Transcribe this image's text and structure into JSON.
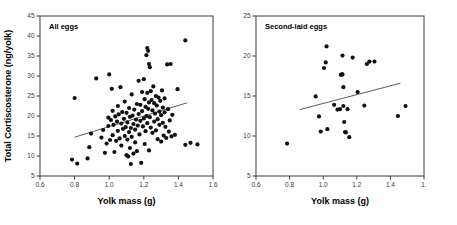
{
  "figure": {
    "axis_titles": {
      "x": "Yolk mass (g)",
      "y": "Total Cortiscosterone (ng/yolk)"
    }
  },
  "chart_data": [
    {
      "type": "scatter",
      "title": "All eggs",
      "xlabel": "Yolk mass (g)",
      "ylabel": "Total Cortiscosterone (ng/yolk)",
      "xlim": [
        0.6,
        1.6
      ],
      "ylim": [
        5,
        45
      ],
      "xticks": [
        0.6,
        0.8,
        1.0,
        1.2,
        1.4,
        1.6
      ],
      "xticklabels": [
        "0.6",
        "0.8",
        "1.0",
        "1.2",
        "1.4",
        "1.6"
      ],
      "yticks": [
        5,
        10,
        15,
        20,
        25,
        30,
        35,
        40,
        45
      ],
      "yticklabels": [
        "5",
        "10",
        "15",
        "20",
        "25",
        "30",
        "35",
        "40",
        "45"
      ],
      "grid": false,
      "legend": "none",
      "marker": "filled-circle",
      "trendline": {
        "x": [
          0.8,
          1.45
        ],
        "y": [
          14.7,
          23.3
        ]
      },
      "points": [
        [
          0.785,
          9.1
        ],
        [
          0.815,
          8.1
        ],
        [
          0.8,
          24.5
        ],
        [
          0.875,
          9.4
        ],
        [
          0.885,
          12.2
        ],
        [
          0.895,
          15.6
        ],
        [
          0.925,
          29.4
        ],
        [
          0.955,
          14.6
        ],
        [
          0.965,
          16.5
        ],
        [
          0.975,
          10.8
        ],
        [
          0.985,
          13.1
        ],
        [
          0.995,
          17.5
        ],
        [
          0.995,
          19.6
        ],
        [
          1.0,
          30.4
        ],
        [
          1.005,
          14.0
        ],
        [
          1.01,
          19.0
        ],
        [
          1.015,
          26.8
        ],
        [
          1.02,
          21.3
        ],
        [
          1.02,
          15.2
        ],
        [
          1.025,
          17.8
        ],
        [
          1.03,
          11.0
        ],
        [
          1.035,
          19.9
        ],
        [
          1.04,
          13.8
        ],
        [
          1.045,
          18.6
        ],
        [
          1.05,
          22.5
        ],
        [
          1.05,
          16.3
        ],
        [
          1.055,
          20.4
        ],
        [
          1.06,
          14.4
        ],
        [
          1.065,
          27.2
        ],
        [
          1.07,
          18.1
        ],
        [
          1.07,
          12.6
        ],
        [
          1.075,
          21.0
        ],
        [
          1.08,
          16.8
        ],
        [
          1.085,
          19.3
        ],
        [
          1.09,
          23.6
        ],
        [
          1.09,
          15.0
        ],
        [
          1.095,
          17.2
        ],
        [
          1.1,
          10.2
        ],
        [
          1.1,
          20.8
        ],
        [
          1.105,
          14.1
        ],
        [
          1.105,
          18.4
        ],
        [
          1.11,
          9.9
        ],
        [
          1.115,
          16.0
        ],
        [
          1.115,
          22.0
        ],
        [
          1.12,
          12.0
        ],
        [
          1.12,
          19.8
        ],
        [
          1.125,
          8.0
        ],
        [
          1.125,
          17.0
        ],
        [
          1.13,
          25.4
        ],
        [
          1.13,
          14.8
        ],
        [
          1.135,
          20.1
        ],
        [
          1.14,
          10.6
        ],
        [
          1.14,
          18.0
        ],
        [
          1.145,
          21.6
        ],
        [
          1.15,
          13.4
        ],
        [
          1.15,
          16.6
        ],
        [
          1.155,
          19.1
        ],
        [
          1.16,
          23.0
        ],
        [
          1.16,
          11.2
        ],
        [
          1.165,
          17.6
        ],
        [
          1.17,
          28.8
        ],
        [
          1.17,
          20.5
        ],
        [
          1.175,
          15.4
        ],
        [
          1.18,
          22.8
        ],
        [
          1.18,
          18.8
        ],
        [
          1.185,
          8.3
        ],
        [
          1.19,
          26.0
        ],
        [
          1.19,
          21.2
        ],
        [
          1.195,
          17.4
        ],
        [
          1.2,
          29.2
        ],
        [
          1.2,
          19.4
        ],
        [
          1.205,
          24.2
        ],
        [
          1.205,
          13.0
        ],
        [
          1.21,
          22.3
        ],
        [
          1.21,
          16.2
        ],
        [
          1.215,
          35.2
        ],
        [
          1.215,
          20.0
        ],
        [
          1.22,
          37.0
        ],
        [
          1.22,
          25.8
        ],
        [
          1.22,
          18.2
        ],
        [
          1.225,
          36.3
        ],
        [
          1.225,
          21.8
        ],
        [
          1.23,
          33.0
        ],
        [
          1.23,
          23.4
        ],
        [
          1.23,
          11.4
        ],
        [
          1.235,
          32.2
        ],
        [
          1.235,
          19.7
        ],
        [
          1.24,
          26.2
        ],
        [
          1.24,
          17.1
        ],
        [
          1.245,
          24.0
        ],
        [
          1.25,
          21.4
        ],
        [
          1.25,
          15.8
        ],
        [
          1.255,
          27.4
        ],
        [
          1.26,
          23.2
        ],
        [
          1.26,
          18.6
        ],
        [
          1.265,
          20.6
        ],
        [
          1.27,
          25.0
        ],
        [
          1.27,
          16.4
        ],
        [
          1.275,
          22.6
        ],
        [
          1.28,
          19.2
        ],
        [
          1.28,
          14.2
        ],
        [
          1.285,
          24.6
        ],
        [
          1.29,
          21.1
        ],
        [
          1.29,
          17.8
        ],
        [
          1.295,
          23.8
        ],
        [
          1.3,
          20.2
        ],
        [
          1.3,
          13.6
        ],
        [
          1.305,
          26.4
        ],
        [
          1.31,
          22.1
        ],
        [
          1.31,
          18.3
        ],
        [
          1.315,
          15.1
        ],
        [
          1.32,
          24.4
        ],
        [
          1.32,
          20.9
        ],
        [
          1.325,
          17.3
        ],
        [
          1.33,
          14.5
        ],
        [
          1.335,
          32.9
        ],
        [
          1.34,
          21.7
        ],
        [
          1.345,
          16.1
        ],
        [
          1.35,
          18.9
        ],
        [
          1.355,
          33.0
        ],
        [
          1.36,
          14.9
        ],
        [
          1.365,
          20.3
        ],
        [
          1.38,
          15.3
        ],
        [
          1.395,
          26.7
        ],
        [
          1.44,
          38.9
        ],
        [
          1.44,
          12.8
        ],
        [
          1.47,
          13.3
        ],
        [
          1.51,
          12.9
        ]
      ]
    },
    {
      "type": "scatter",
      "title": "Second-laid eggs",
      "xlabel": "Yolk mass (g)",
      "ylabel": "Total Cortiscosterone (ng/yolk)",
      "xlim": [
        0.6,
        1.6
      ],
      "ylim": [
        5,
        25
      ],
      "xticks": [
        0.6,
        0.8,
        1.0,
        1.2,
        1.4,
        1.6
      ],
      "xticklabels": [
        "0.6",
        "0.8",
        "1.0",
        "1.2",
        "1.4",
        "1."
      ],
      "yticks": [
        5,
        10,
        15,
        20,
        25
      ],
      "yticklabels": [
        "5",
        "10",
        "15",
        "20",
        "25"
      ],
      "grid": false,
      "legend": "none",
      "marker": "filled-circle",
      "trendline": {
        "x": [
          0.86,
          1.46
        ],
        "y": [
          13.3,
          16.6
        ]
      },
      "points": [
        [
          0.785,
          9.05
        ],
        [
          0.955,
          14.95
        ],
        [
          0.975,
          12.45
        ],
        [
          0.985,
          10.55
        ],
        [
          1.005,
          18.5
        ],
        [
          1.015,
          19.2
        ],
        [
          1.02,
          21.2
        ],
        [
          1.025,
          10.85
        ],
        [
          1.065,
          13.9
        ],
        [
          1.085,
          13.3
        ],
        [
          1.1,
          13.35
        ],
        [
          1.105,
          17.65
        ],
        [
          1.11,
          17.7
        ],
        [
          1.115,
          17.7
        ],
        [
          1.115,
          20.05
        ],
        [
          1.12,
          13.75
        ],
        [
          1.12,
          16.1
        ],
        [
          1.125,
          11.75
        ],
        [
          1.13,
          10.5
        ],
        [
          1.135,
          10.45
        ],
        [
          1.145,
          13.35
        ],
        [
          1.155,
          9.85
        ],
        [
          1.175,
          19.8
        ],
        [
          1.205,
          15.5
        ],
        [
          1.245,
          13.8
        ],
        [
          1.26,
          19.0
        ],
        [
          1.275,
          19.3
        ],
        [
          1.305,
          19.3
        ],
        [
          1.445,
          12.5
        ],
        [
          1.49,
          13.75
        ]
      ]
    }
  ]
}
